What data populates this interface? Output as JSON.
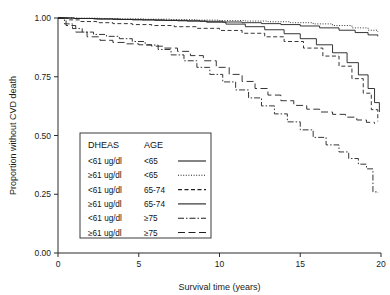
{
  "chart_data": {
    "type": "line",
    "title": "",
    "subtitle": "",
    "xlabel": "Survival time (years)",
    "ylabel": "Proportion without CVD death",
    "xlim": [
      0,
      20
    ],
    "ylim": [
      0,
      1
    ],
    "xticks": [
      "0",
      "5",
      "10",
      "15",
      "20"
    ],
    "xtick_values": [
      0,
      5,
      10,
      15,
      20
    ],
    "yticks": [
      "0.00",
      "0.25",
      "0.50",
      "0.75",
      "1.00"
    ],
    "ytick_values": [
      0,
      0.25,
      0.5,
      0.75,
      1
    ],
    "grid": false,
    "legend_position": "inside-lower-left",
    "legend_headers": [
      "DHEAS",
      "AGE"
    ],
    "annotations": [],
    "series": [
      {
        "name": "<61 ug/dl, <65",
        "dhaes": "<61 ug/dl",
        "age": "<65",
        "style": "solid",
        "dasharray": "",
        "x": [
          0,
          1.0,
          2.2,
          3.4,
          4.6,
          6.0,
          7.4,
          8.8,
          10.2,
          11.4,
          12.6,
          13.8,
          15.0,
          16.2,
          17.4,
          18.4,
          19.2,
          19.8
        ],
        "y": [
          1.0,
          0.998,
          0.996,
          0.994,
          0.992,
          0.99,
          0.988,
          0.986,
          0.983,
          0.98,
          0.976,
          0.972,
          0.966,
          0.958,
          0.948,
          0.938,
          0.928,
          0.922
        ]
      },
      {
        "name": "≥61 ug/dl, <65",
        "dhaes": "≥61 ug/dl",
        "age": "<65",
        "style": "dotted",
        "dasharray": "1,1.6",
        "x": [
          0,
          1.2,
          2.6,
          4.0,
          5.4,
          7.0,
          8.6,
          10.0,
          11.6,
          13.0,
          14.4,
          15.8,
          17.0,
          18.2,
          19.2,
          19.8
        ],
        "y": [
          1.0,
          0.999,
          0.997,
          0.996,
          0.995,
          0.993,
          0.991,
          0.989,
          0.987,
          0.984,
          0.98,
          0.975,
          0.968,
          0.958,
          0.948,
          0.942
        ]
      },
      {
        "name": "<61 ug/dl, 65-74",
        "dhaes": "<61 ug/dl",
        "age": "65-74",
        "style": "dashed",
        "dasharray": "4,2.5",
        "x": [
          0,
          0.6,
          1.4,
          2.4,
          3.4,
          4.6,
          5.8,
          7.2,
          8.6,
          10.0,
          11.4,
          12.8,
          14.0,
          15.2,
          16.4,
          17.4,
          18.2,
          18.9,
          19.4,
          19.8
        ],
        "y": [
          1.0,
          0.992,
          0.985,
          0.98,
          0.976,
          0.972,
          0.968,
          0.963,
          0.956,
          0.947,
          0.935,
          0.92,
          0.9,
          0.872,
          0.838,
          0.795,
          0.742,
          0.68,
          0.61,
          0.56
        ]
      },
      {
        "name": "≥61 ug/dl, 65-74",
        "dhaes": "≥61 ug/dl",
        "age": "65-74",
        "style": "long-solid",
        "dasharray": "",
        "x": [
          0,
          1.0,
          2.4,
          3.8,
          5.2,
          6.6,
          8.0,
          9.2,
          10.4,
          11.6,
          12.8,
          14.0,
          15.0,
          16.0,
          17.0,
          17.9,
          18.6,
          19.2,
          19.6,
          19.9
        ],
        "y": [
          1.0,
          0.998,
          0.996,
          0.994,
          0.992,
          0.99,
          0.987,
          0.982,
          0.974,
          0.963,
          0.95,
          0.933,
          0.912,
          0.886,
          0.852,
          0.81,
          0.758,
          0.7,
          0.64,
          0.6
        ]
      },
      {
        "name": "<61 ug/dl, ≥75",
        "dhaes": "<61 ug/dl",
        "age": "≥75",
        "style": "dash-dot",
        "dasharray": "6,2,1.5,2",
        "x": [
          0,
          0.4,
          0.9,
          1.5,
          2.2,
          3.0,
          3.8,
          4.6,
          5.4,
          6.2,
          7.0,
          7.8,
          8.6,
          9.4,
          10.2,
          11.0,
          11.8,
          12.6,
          13.4,
          14.2,
          15.0,
          15.8,
          16.6,
          17.4,
          18.0,
          18.6,
          19.1,
          19.5,
          19.5,
          19.8
        ],
        "y": [
          1.0,
          0.975,
          0.955,
          0.94,
          0.93,
          0.922,
          0.912,
          0.9,
          0.885,
          0.866,
          0.843,
          0.818,
          0.79,
          0.76,
          0.728,
          0.694,
          0.66,
          0.626,
          0.592,
          0.558,
          0.524,
          0.492,
          0.46,
          0.43,
          0.402,
          0.378,
          0.358,
          0.345,
          0.26,
          0.255
        ]
      },
      {
        "name": "≥61 ug/dl, ≥75",
        "dhaes": "≥61 ug/dl",
        "age": "≥75",
        "style": "long-dash",
        "dasharray": "7,3.5",
        "x": [
          0,
          0.5,
          1.1,
          1.8,
          2.6,
          3.4,
          4.2,
          5.0,
          5.8,
          6.6,
          7.4,
          8.2,
          9.0,
          9.8,
          10.6,
          11.4,
          12.2,
          13.0,
          13.8,
          14.6,
          15.4,
          16.2,
          17.0,
          17.8,
          18.5,
          19.1,
          19.6
        ],
        "y": [
          1.0,
          0.968,
          0.94,
          0.92,
          0.905,
          0.896,
          0.89,
          0.886,
          0.88,
          0.872,
          0.858,
          0.84,
          0.818,
          0.79,
          0.76,
          0.73,
          0.7,
          0.672,
          0.648,
          0.628,
          0.612,
          0.6,
          0.59,
          0.578,
          0.566,
          0.556,
          0.55
        ]
      }
    ],
    "legend_entries": [
      {
        "dhaes": "<61 ug/dl",
        "age": "<65",
        "style": "solid",
        "dasharray": ""
      },
      {
        "dhaes": "≥61 ug/dl",
        "age": "<65",
        "style": "dotted",
        "dasharray": "1,1.6"
      },
      {
        "dhaes": "<61 ug/dl",
        "age": "65-74",
        "style": "dashed",
        "dasharray": "4,2.5"
      },
      {
        "dhaes": "≥61 ug/dl",
        "age": "65-74",
        "style": "long-solid",
        "dasharray": ""
      },
      {
        "dhaes": "<61 ug/dl",
        "age": "≥75",
        "style": "dash-dot",
        "dasharray": "6,2,1.5,2"
      },
      {
        "dhaes": "≥61 ug/dl",
        "age": "≥75",
        "style": "long-dash",
        "dasharray": "7,3.5"
      }
    ]
  }
}
